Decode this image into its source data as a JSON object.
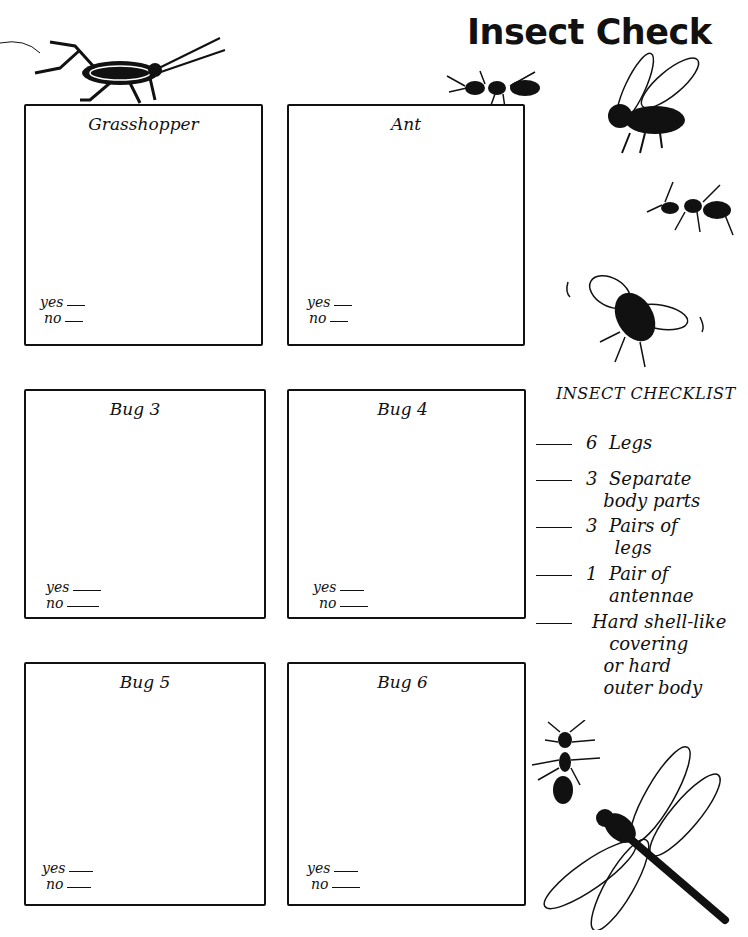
{
  "page": {
    "title": "Insect Check"
  },
  "boxes": [
    {
      "label": "Grasshopper",
      "yes_label": "yes",
      "no_label": "no"
    },
    {
      "label": "Ant",
      "yes_label": "yes",
      "no_label": "no"
    },
    {
      "label": "Bug 3",
      "yes_label": "yes",
      "no_label": "no"
    },
    {
      "label": "Bug 4",
      "yes_label": "yes",
      "no_label": "no"
    },
    {
      "label": "Bug 5",
      "yes_label": "yes",
      "no_label": "no"
    },
    {
      "label": "Bug 6",
      "yes_label": "yes",
      "no_label": "no"
    }
  ],
  "checklist": {
    "title": "INSECT CHECKLIST",
    "items": [
      {
        "text": "6  Legs"
      },
      {
        "text": "3  Separate\n   body parts"
      },
      {
        "text": "3  Pairs of\n     legs"
      },
      {
        "text": "1  Pair of\n    antennae"
      },
      {
        "text": "Hard shell-like\n   covering\n  or hard\n  outer body"
      }
    ]
  },
  "illustrations": [
    {
      "icon": "cricket-icon"
    },
    {
      "icon": "ant-icon"
    },
    {
      "icon": "fly-icon"
    },
    {
      "icon": "ant-icon"
    },
    {
      "icon": "bee-icon"
    },
    {
      "icon": "ant-icon"
    },
    {
      "icon": "dragonfly-icon"
    }
  ]
}
